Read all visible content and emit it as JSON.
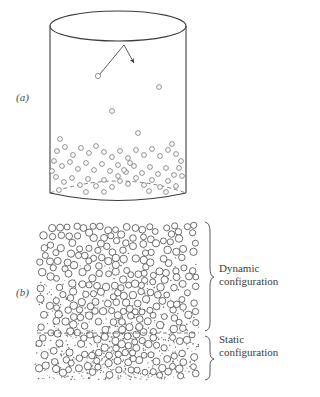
{
  "figure": {
    "type": "scientific-illustration",
    "background_color": "#ffffff",
    "ink_color": "#3d3d3d",
    "width": 295,
    "height": 397
  },
  "panels": [
    {
      "id": "a",
      "label": "(a)",
      "label_x": 16,
      "label_y": 101,
      "description": "vessel-with-particles",
      "vessel": {
        "left": 50,
        "right": 186,
        "top_ellipse_cy": 26,
        "top_ellipse_rx": 68,
        "top_ellipse_ry": 15,
        "bottom_y": 193,
        "bottom_ellipse_ry": 12,
        "bottom_hidden_dashed": true
      },
      "trajectory": {
        "start_particle": {
          "cx": 98,
          "cy": 76,
          "r": 2.6
        },
        "impact_point": {
          "x": 124,
          "y": 45
        },
        "arrow_tip": {
          "x": 135,
          "y": 64
        },
        "arrowhead": true
      }
    },
    {
      "id": "b",
      "label": "(b)",
      "label_x": 16,
      "label_y": 296,
      "description": "dense-bed-two-zones",
      "region": {
        "left": 35,
        "right": 200,
        "top": 222,
        "bottom": 380
      },
      "divider": {
        "y": 333,
        "style": "dashed",
        "x1": 35,
        "x2": 200
      }
    }
  ],
  "annotations": [
    {
      "name": "dynamic-configuration",
      "lines": [
        "Dynamic",
        "configuration"
      ],
      "text": "Dynamic configuration",
      "brace": {
        "x": 207,
        "top": 222,
        "bottom": 331,
        "direction": "left"
      },
      "text_x": 219,
      "text_y_first_line": 272
    },
    {
      "name": "static-configuration",
      "lines": [
        "Static",
        "configuration"
      ],
      "text": "Static configuration",
      "brace": {
        "x": 207,
        "top": 336,
        "bottom": 380,
        "direction": "left"
      },
      "text_x": 219,
      "text_y_first_line": 343
    }
  ],
  "particles_a_sparse": [
    {
      "cx": 98,
      "cy": 76,
      "r": 2.6
    },
    {
      "cx": 159,
      "cy": 87,
      "r": 2.4
    },
    {
      "cx": 112,
      "cy": 111,
      "r": 2.4
    },
    {
      "cx": 138,
      "cy": 133,
      "r": 2.4
    },
    {
      "cx": 60,
      "cy": 139,
      "r": 2.4
    },
    {
      "cx": 172,
      "cy": 144,
      "r": 2.4
    }
  ],
  "particles_a_bed": [
    {
      "cx": 57,
      "cy": 151,
      "r": 2.4
    },
    {
      "cx": 65,
      "cy": 147,
      "r": 2.4
    },
    {
      "cx": 73,
      "cy": 155,
      "r": 2.4
    },
    {
      "cx": 81,
      "cy": 148,
      "r": 2.4
    },
    {
      "cx": 89,
      "cy": 153,
      "r": 2.4
    },
    {
      "cx": 96,
      "cy": 146,
      "r": 2.4
    },
    {
      "cx": 104,
      "cy": 152,
      "r": 2.4
    },
    {
      "cx": 112,
      "cy": 157,
      "r": 2.4
    },
    {
      "cx": 120,
      "cy": 151,
      "r": 2.4
    },
    {
      "cx": 128,
      "cy": 158,
      "r": 2.4
    },
    {
      "cx": 136,
      "cy": 150,
      "r": 2.4
    },
    {
      "cx": 144,
      "cy": 155,
      "r": 2.4
    },
    {
      "cx": 152,
      "cy": 149,
      "r": 2.4
    },
    {
      "cx": 160,
      "cy": 156,
      "r": 2.4
    },
    {
      "cx": 168,
      "cy": 150,
      "r": 2.4
    },
    {
      "cx": 176,
      "cy": 154,
      "r": 2.4
    },
    {
      "cx": 54,
      "cy": 161,
      "r": 2.4
    },
    {
      "cx": 62,
      "cy": 166,
      "r": 2.4
    },
    {
      "cx": 70,
      "cy": 162,
      "r": 2.4
    },
    {
      "cx": 78,
      "cy": 169,
      "r": 2.4
    },
    {
      "cx": 86,
      "cy": 163,
      "r": 2.4
    },
    {
      "cx": 94,
      "cy": 170,
      "r": 2.4
    },
    {
      "cx": 102,
      "cy": 164,
      "r": 2.4
    },
    {
      "cx": 110,
      "cy": 171,
      "r": 2.4
    },
    {
      "cx": 118,
      "cy": 165,
      "r": 2.4
    },
    {
      "cx": 126,
      "cy": 172,
      "r": 2.4
    },
    {
      "cx": 134,
      "cy": 166,
      "r": 2.4
    },
    {
      "cx": 142,
      "cy": 173,
      "r": 2.4
    },
    {
      "cx": 150,
      "cy": 167,
      "r": 2.4
    },
    {
      "cx": 158,
      "cy": 174,
      "r": 2.4
    },
    {
      "cx": 166,
      "cy": 168,
      "r": 2.4
    },
    {
      "cx": 174,
      "cy": 175,
      "r": 2.4
    },
    {
      "cx": 181,
      "cy": 161,
      "r": 2.4
    },
    {
      "cx": 56,
      "cy": 177,
      "r": 2.4
    },
    {
      "cx": 64,
      "cy": 182,
      "r": 2.4
    },
    {
      "cx": 72,
      "cy": 178,
      "r": 2.4
    },
    {
      "cx": 80,
      "cy": 185,
      "r": 2.4
    },
    {
      "cx": 88,
      "cy": 179,
      "r": 2.4
    },
    {
      "cx": 96,
      "cy": 186,
      "r": 2.4
    },
    {
      "cx": 104,
      "cy": 180,
      "r": 2.4
    },
    {
      "cx": 112,
      "cy": 187,
      "r": 2.4
    },
    {
      "cx": 120,
      "cy": 181,
      "r": 2.4
    },
    {
      "cx": 128,
      "cy": 184,
      "r": 2.4
    },
    {
      "cx": 136,
      "cy": 178,
      "r": 2.4
    },
    {
      "cx": 144,
      "cy": 185,
      "r": 2.4
    },
    {
      "cx": 152,
      "cy": 180,
      "r": 2.4
    },
    {
      "cx": 160,
      "cy": 187,
      "r": 2.4
    },
    {
      "cx": 168,
      "cy": 181,
      "r": 2.4
    },
    {
      "cx": 176,
      "cy": 186,
      "r": 2.4
    },
    {
      "cx": 182,
      "cy": 176,
      "r": 2.4
    },
    {
      "cx": 59,
      "cy": 190,
      "r": 2.4
    },
    {
      "cx": 86,
      "cy": 192,
      "r": 2.4
    },
    {
      "cx": 118,
      "cy": 176,
      "r": 2.4
    },
    {
      "cx": 124,
      "cy": 170,
      "r": 2.4
    },
    {
      "cx": 130,
      "cy": 163,
      "r": 2.4
    },
    {
      "cx": 149,
      "cy": 191,
      "r": 2.4
    },
    {
      "cx": 166,
      "cy": 192,
      "r": 2.4
    },
    {
      "cx": 52,
      "cy": 171,
      "r": 2.4
    },
    {
      "cx": 179,
      "cy": 168,
      "r": 2.4
    },
    {
      "cx": 104,
      "cy": 192,
      "r": 2.4
    }
  ],
  "legend_note": "Open circles represent particles; stippled dots represent fluid/fine phase."
}
